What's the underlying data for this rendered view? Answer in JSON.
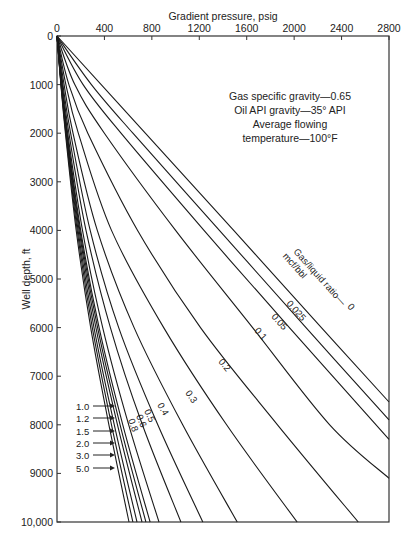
{
  "chart_data": {
    "type": "line",
    "title": "",
    "xlabel": "Gradient pressure, psig",
    "ylabel": "Well depth, ft",
    "xlim": [
      0,
      2800
    ],
    "ylim": [
      0,
      10000
    ],
    "y_inverted": true,
    "x_axis_position": "top",
    "x_ticks": [
      0,
      400,
      800,
      1200,
      1600,
      2000,
      2400,
      2800
    ],
    "x_tick_labels": [
      "0",
      "400",
      "800",
      "1200",
      "1600",
      "2000",
      "2400",
      "2800"
    ],
    "y_ticks": [
      0,
      1000,
      2000,
      3000,
      4000,
      5000,
      6000,
      7000,
      8000,
      9000,
      10000
    ],
    "y_tick_labels": [
      "0",
      "1000",
      "2000",
      "3000",
      "4000",
      "5000",
      "6000",
      "7000",
      "8000",
      "9000",
      "10,000"
    ],
    "grid": false,
    "annotations": [
      "Gas specific gravity—0.65",
      "Oil API gravity—35° API",
      "Average flowing",
      "temperature—100°F"
    ],
    "legend_title": [
      "Gas/liquid ratio—",
      "mcf/bbl"
    ],
    "series": [
      {
        "name": "0",
        "depth": [
          0,
          2000,
          4000,
          6000,
          7530
        ],
        "pressure": [
          0,
          745,
          1490,
          2230,
          2800
        ]
      },
      {
        "name": "0.025",
        "depth": [
          0,
          1000,
          2000,
          4000,
          6000,
          7900
        ],
        "pressure": [
          0,
          290,
          640,
          1370,
          2100,
          2800
        ]
      },
      {
        "name": "0.05",
        "depth": [
          0,
          1000,
          2000,
          4000,
          6000,
          8300
        ],
        "pressure": [
          0,
          220,
          540,
          1240,
          1960,
          2800
        ]
      },
      {
        "name": "0.1",
        "depth": [
          0,
          1000,
          2000,
          4000,
          6000,
          8000,
          9100
        ],
        "pressure": [
          0,
          150,
          400,
          1000,
          1650,
          2300,
          2800
        ]
      },
      {
        "name": "0.2",
        "depth": [
          0,
          1000,
          2000,
          4000,
          6000,
          8000,
          10000
        ],
        "pressure": [
          0,
          100,
          260,
          680,
          1210,
          1860,
          2540
        ]
      },
      {
        "name": "0.3",
        "depth": [
          0,
          1000,
          2000,
          4000,
          6000,
          8000,
          10000
        ],
        "pressure": [
          0,
          75,
          180,
          460,
          900,
          1430,
          2025
        ]
      },
      {
        "name": "0.4",
        "depth": [
          0,
          1000,
          2000,
          4000,
          6000,
          8000,
          10000
        ],
        "pressure": [
          0,
          60,
          135,
          340,
          650,
          1060,
          1520
        ]
      },
      {
        "name": "0.5",
        "depth": [
          0,
          1000,
          2000,
          4000,
          6000,
          8000,
          10000
        ],
        "pressure": [
          0,
          50,
          115,
          280,
          520,
          850,
          1230
        ]
      },
      {
        "name": "0.6",
        "depth": [
          0,
          1000,
          2000,
          4000,
          6000,
          8000,
          10000
        ],
        "pressure": [
          0,
          45,
          100,
          245,
          450,
          720,
          1045
        ]
      },
      {
        "name": "0.8",
        "depth": [
          0,
          1000,
          2000,
          4000,
          6000,
          8000,
          10000
        ],
        "pressure": [
          0,
          40,
          90,
          215,
          385,
          605,
          860
        ]
      },
      {
        "name": "1.0",
        "depth": [
          0,
          1000,
          2000,
          4000,
          6000,
          8000,
          10000
        ],
        "pressure": [
          0,
          38,
          85,
          200,
          355,
          555,
          785
        ]
      },
      {
        "name": "1.2",
        "depth": [
          0,
          1000,
          2000,
          4000,
          6000,
          8000,
          10000
        ],
        "pressure": [
          0,
          37,
          82,
          193,
          342,
          532,
          750
        ]
      },
      {
        "name": "1.5",
        "depth": [
          0,
          1000,
          2000,
          4000,
          6000,
          8000,
          10000
        ],
        "pressure": [
          0,
          36,
          80,
          186,
          328,
          510,
          717
        ]
      },
      {
        "name": "2.0",
        "depth": [
          0,
          1000,
          2000,
          4000,
          6000,
          8000,
          10000
        ],
        "pressure": [
          0,
          35,
          77,
          178,
          312,
          483,
          675
        ]
      },
      {
        "name": "3.0",
        "depth": [
          0,
          1000,
          2000,
          4000,
          6000,
          8000,
          10000
        ],
        "pressure": [
          0,
          34,
          74,
          170,
          298,
          460,
          640
        ]
      },
      {
        "name": "5.0",
        "depth": [
          0,
          1000,
          2000,
          4000,
          6000,
          8000,
          10000
        ],
        "pressure": [
          0,
          33,
          71,
          162,
          284,
          438,
          607
        ]
      }
    ],
    "curve_labels": [
      {
        "text": "0",
        "x": 347,
        "y": 307,
        "rot": 48
      },
      {
        "text": "0.025",
        "x": 286,
        "y": 304,
        "rot": 48
      },
      {
        "text": "0.05",
        "x": 271,
        "y": 317,
        "rot": 48
      },
      {
        "text": "0.1",
        "x": 254,
        "y": 331,
        "rot": 48
      },
      {
        "text": "0.2",
        "x": 218,
        "y": 362,
        "rot": 50
      },
      {
        "text": "0.3",
        "x": 185,
        "y": 393,
        "rot": 55
      },
      {
        "text": "0.4",
        "x": 157,
        "y": 405,
        "rot": 60
      },
      {
        "text": "0.5",
        "x": 144,
        "y": 411,
        "rot": 65
      },
      {
        "text": "0.6",
        "x": 136,
        "y": 416,
        "rot": 68
      },
      {
        "text": "0.8",
        "x": 128,
        "y": 420,
        "rot": 70
      }
    ],
    "arrow_labels": [
      {
        "text": "1.0",
        "y": 406
      },
      {
        "text": "1.2",
        "y": 418
      },
      {
        "text": "1.5",
        "y": 431
      },
      {
        "text": "2.0",
        "y": 443
      },
      {
        "text": "3.0",
        "y": 455
      },
      {
        "text": "5.0",
        "y": 468
      }
    ]
  }
}
